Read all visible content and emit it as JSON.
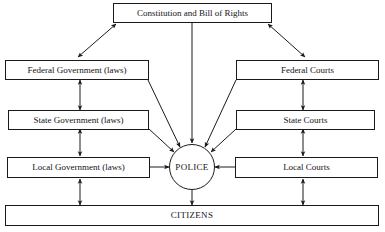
{
  "diagram": {
    "type": "flow-diagram",
    "background_color": "#ffffff",
    "line_color": "#1a1a1a",
    "text_color": "#141414",
    "nodes": {
      "constitution": {
        "label": "Constitution and Bill of Rights",
        "shape": "rect"
      },
      "federal_government": {
        "label": "Federal Government (laws)",
        "shape": "rect"
      },
      "state_government": {
        "label": "State Government (laws)",
        "shape": "rect"
      },
      "local_government": {
        "label": "Local Government (laws)",
        "shape": "rect"
      },
      "federal_courts": {
        "label": "Federal Courts",
        "shape": "rect"
      },
      "state_courts": {
        "label": "State Courts",
        "shape": "rect"
      },
      "local_courts": {
        "label": "Local Courts",
        "shape": "rect"
      },
      "police": {
        "label": "POLICE",
        "shape": "circle"
      },
      "citizens": {
        "label": "CITIZENS",
        "shape": "rect"
      }
    },
    "edges": [
      {
        "from": "constitution",
        "to": "federal_government",
        "arrow": "double"
      },
      {
        "from": "constitution",
        "to": "federal_courts",
        "arrow": "double"
      },
      {
        "from": "constitution",
        "to": "police",
        "arrow": "single"
      },
      {
        "from": "federal_government",
        "to": "state_government",
        "arrow": "double"
      },
      {
        "from": "state_government",
        "to": "local_government",
        "arrow": "double"
      },
      {
        "from": "local_government",
        "to": "citizens",
        "arrow": "double"
      },
      {
        "from": "federal_courts",
        "to": "state_courts",
        "arrow": "double"
      },
      {
        "from": "state_courts",
        "to": "local_courts",
        "arrow": "double"
      },
      {
        "from": "local_courts",
        "to": "citizens",
        "arrow": "double"
      },
      {
        "from": "federal_government",
        "to": "police",
        "arrow": "single"
      },
      {
        "from": "state_government",
        "to": "police",
        "arrow": "single"
      },
      {
        "from": "local_government",
        "to": "police",
        "arrow": "single"
      },
      {
        "from": "federal_courts",
        "to": "police",
        "arrow": "single"
      },
      {
        "from": "state_courts",
        "to": "police",
        "arrow": "single"
      },
      {
        "from": "local_courts",
        "to": "police",
        "arrow": "single"
      },
      {
        "from": "police",
        "to": "citizens",
        "arrow": "single"
      }
    ]
  }
}
